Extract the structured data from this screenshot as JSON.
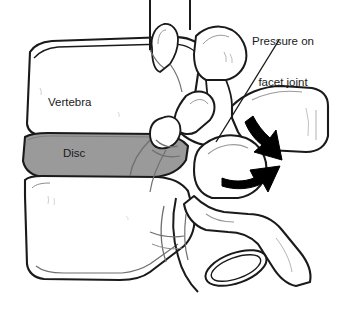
{
  "figure": {
    "background_color": "#ffffff",
    "width": 338,
    "height": 309
  },
  "labels": {
    "vertebra": "Vertebra",
    "disc": "Disc",
    "pressure_line1": "Pressure on",
    "pressure_line2": "facet joint"
  },
  "colors": {
    "outline": "#1a1a1a",
    "disc_fill": "#9a9a9a",
    "bone_fill": "#ffffff",
    "arrow_fill": "#000000",
    "detail_line": "#6f6f6f",
    "text": "#1a1a1a"
  },
  "elements": {
    "upper_vertebral_body": "upper-vertebral-body",
    "lower_vertebral_body": "lower-vertebral-body",
    "intervertebral_disc": "intervertebral-disc",
    "upper_spinous_process": "upper-spinous-process",
    "superior_articular_process": "superior-articular-process",
    "facet_joint": "facet-joint",
    "posterior_process": "posterior-process",
    "transverse_process_ring": "transverse-process-ring",
    "arrow_down": "pressure-arrow-down",
    "arrow_up": "pressure-arrow-up",
    "leader_line": "pressure-leader-line"
  }
}
